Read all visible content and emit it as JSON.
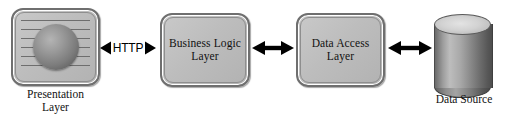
{
  "diagram": {
    "canvas": {
      "width": 509,
      "height": 123,
      "background": "#ffffff"
    },
    "colors": {
      "box_fill": "#bdbdbd",
      "box_border": "#6f6f6f",
      "arrow": "#000000",
      "text": "#111111",
      "cylinder_light": "#bdbdbd",
      "cylinder_dark": "#4e4e4e"
    },
    "nodes": [
      {
        "id": "presentation",
        "type": "screen-icon-box",
        "inner_label": "",
        "caption": "Presentation\nLayer",
        "caption_line1": "Presentation",
        "caption_line2": "Layer"
      },
      {
        "id": "business-logic",
        "type": "rounded-box",
        "inner_label": "Business Logic\nLayer",
        "label_line1": "Business Logic",
        "label_line2": "Layer",
        "caption": ""
      },
      {
        "id": "data-access",
        "type": "rounded-box",
        "inner_label": "Data Access\nLayer",
        "label_line1": "Data Access",
        "label_line2": "Layer",
        "caption": ""
      },
      {
        "id": "data-source",
        "type": "cylinder",
        "inner_label": "",
        "caption": "Data Source"
      }
    ],
    "connectors": [
      {
        "id": "presentation-to-business-logic",
        "from": "presentation",
        "to": "business-logic",
        "style": "double-headed",
        "label": "HTTP"
      },
      {
        "id": "business-logic-to-data-access",
        "from": "business-logic",
        "to": "data-access",
        "style": "double-headed",
        "label": ""
      },
      {
        "id": "data-access-to-data-source",
        "from": "data-access",
        "to": "data-source",
        "style": "double-headed",
        "label": ""
      }
    ]
  }
}
